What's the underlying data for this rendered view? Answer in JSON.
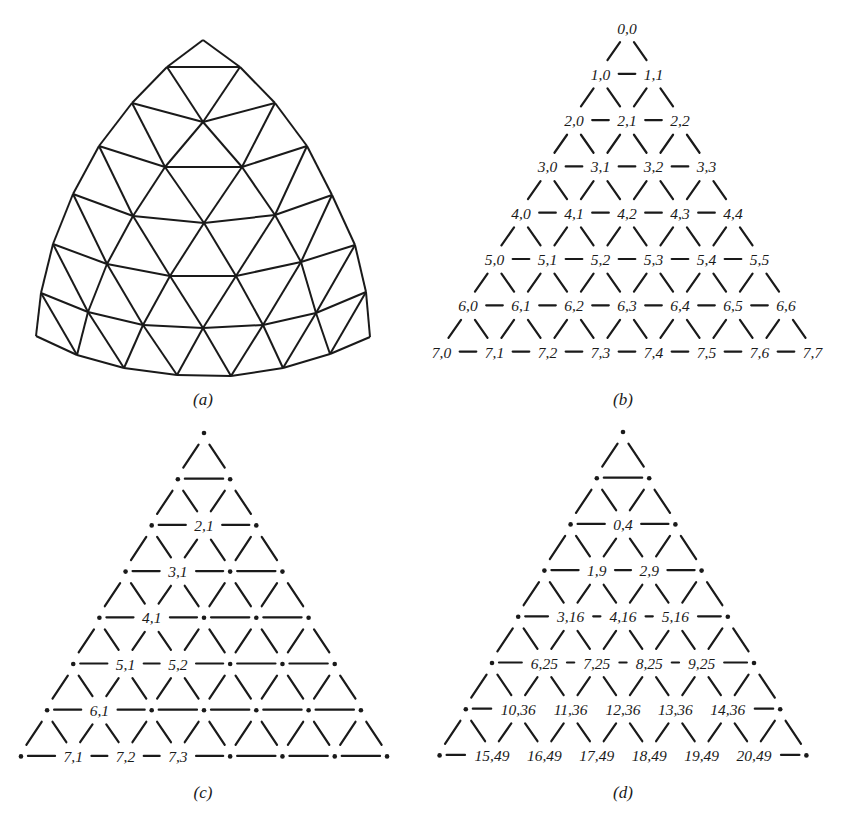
{
  "figure": {
    "panels": [
      {
        "id": "a",
        "caption": "(a)",
        "description": "Curved triangular mesh (spherical triangle subdivided 7 times)",
        "subdivisions": 7,
        "vertices": [
          [
            [
              203,
              40
            ]
          ],
          [
            [
              167,
              67
            ],
            [
              240,
              67
            ]
          ],
          [
            [
              132,
              103
            ],
            [
              203,
              122
            ],
            [
              275,
              103
            ]
          ],
          [
            [
              99,
              146
            ],
            [
              165,
              167
            ],
            [
              242,
              167
            ],
            [
              307,
              146
            ]
          ],
          [
            [
              73,
              194
            ],
            [
              133,
              216
            ],
            [
              204,
              223
            ],
            [
              275,
              215
            ],
            [
              332,
              195
            ]
          ],
          [
            [
              53,
              244
            ],
            [
              107,
              264
            ],
            [
              170,
              276
            ],
            [
              236,
              276
            ],
            [
              301,
              262
            ],
            [
              355,
              245
            ]
          ],
          [
            [
              41,
              293
            ],
            [
              88,
              312
            ],
            [
              143,
              325
            ],
            [
              203,
              328
            ],
            [
              263,
              325
            ],
            [
              316,
              313
            ],
            [
              366,
              292
            ]
          ],
          [
            [
              36,
              336
            ],
            [
              77,
              355
            ],
            [
              124,
              368
            ],
            [
              177,
              375
            ],
            [
              231,
              376
            ],
            [
              283,
              368
            ],
            [
              330,
              354
            ],
            [
              370,
              337
            ]
          ]
        ]
      },
      {
        "id": "b",
        "caption": "(b)",
        "description": "Lattice vertex indices i,j",
        "rows": [
          [
            "0,0"
          ],
          [
            "1,0",
            "1,1"
          ],
          [
            "2,0",
            "2,1",
            "2,2"
          ],
          [
            "3,0",
            "3,1",
            "3,2",
            "3,3"
          ],
          [
            "4,0",
            "4,1",
            "4,2",
            "4,3",
            "4,4"
          ],
          [
            "5,0",
            "5,1",
            "5,2",
            "5,3",
            "5,4",
            "5,5"
          ],
          [
            "6,0",
            "6,1",
            "6,2",
            "6,3",
            "6,4",
            "6,5",
            "6,6"
          ],
          [
            "7,0",
            "7,1",
            "7,2",
            "7,3",
            "7,4",
            "7,5",
            "7,6",
            "7,7"
          ]
        ]
      },
      {
        "id": "c",
        "caption": "(c)",
        "description": "Lattice with selected interior vertices labeled; others shown as dots",
        "rows": [
          [
            null
          ],
          [
            null,
            null
          ],
          [
            null,
            "2,1",
            null
          ],
          [
            null,
            "3,1",
            null,
            null
          ],
          [
            null,
            "4,1",
            null,
            null,
            null
          ],
          [
            null,
            "5,1",
            "5,2",
            null,
            null,
            null
          ],
          [
            null,
            "6,1",
            null,
            null,
            null,
            null,
            null
          ],
          [
            null,
            "7,1",
            "7,2",
            "7,3",
            null,
            null,
            null,
            null
          ]
        ]
      },
      {
        "id": "d",
        "caption": "(d)",
        "description": "Interior vertices labeled with sequential index and row offset",
        "rows": [
          [
            null
          ],
          [
            null,
            null
          ],
          [
            null,
            "0,4",
            null
          ],
          [
            null,
            "1,9",
            "2,9",
            null
          ],
          [
            null,
            "3,16",
            "4,16",
            "5,16",
            null
          ],
          [
            null,
            "6,25",
            "7,25",
            "8,25",
            "9,25",
            null
          ],
          [
            null,
            "10,36",
            "11,36",
            "12,36",
            "13,36",
            "14,36",
            null
          ],
          [
            null,
            "15,49",
            "16,49",
            "17,49",
            "18,49",
            "19,49",
            "20,49",
            null
          ]
        ]
      }
    ]
  }
}
